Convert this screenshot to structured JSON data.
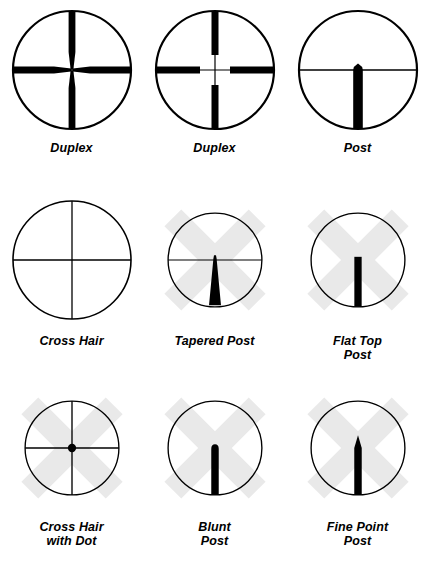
{
  "page": {
    "background_color": "#ffffff",
    "ink_color": "#000000",
    "watermark_color": "#e9e9e9",
    "columns": 3,
    "rows": 3
  },
  "watermark": {
    "name": "x-cross-watermark",
    "color": "#e9e9e9",
    "shape": "diagonal-cross",
    "band_width": 30,
    "length": 150
  },
  "reticles": [
    {
      "id": "duplex-tapered",
      "label": "Duplex",
      "type": "duplex",
      "variant": "tapered",
      "watermark": false,
      "has_horizontal_line": true,
      "has_vertical_line": true,
      "thick_bar_width": 7,
      "thin_line_width": 1.2,
      "taper_start_radius": 22,
      "description": "Thick posts from rim tapering to fine crosshair at center"
    },
    {
      "id": "duplex-blunt",
      "label": "Duplex",
      "type": "duplex",
      "variant": "blunt",
      "watermark": false,
      "has_horizontal_line": true,
      "has_vertical_line": true,
      "thick_bar_width": 7,
      "thin_line_width": 1.2,
      "gap_radius": 24,
      "description": "Thick posts from rim stopping abruptly, fine crosshair continues to center"
    },
    {
      "id": "post",
      "label": "Post",
      "type": "post",
      "variant": "peaked",
      "watermark": false,
      "has_horizontal_line": true,
      "has_vertical_line": false,
      "post_width": 9,
      "tip": "small-peak",
      "tip_height": 7,
      "description": "Horizontal hair with heavy vertical post rising from bottom to a small peaked tip"
    },
    {
      "id": "cross-hair",
      "label": "Cross Hair",
      "type": "crosshair",
      "variant": "plain",
      "watermark": false,
      "has_horizontal_line": true,
      "has_vertical_line": true,
      "line_width": 1.2,
      "description": "Plain fine crosshair spanning full field"
    },
    {
      "id": "tapered-post",
      "label": "Tapered Post",
      "type": "post",
      "variant": "tapered",
      "watermark": true,
      "has_horizontal_line": true,
      "has_vertical_line": false,
      "base_width": 15,
      "tip_width": 3,
      "tip_height": 6,
      "description": "Horizontal hair with wedge-shaped post widening toward the bottom"
    },
    {
      "id": "flat-top-post",
      "label": "Flat Top\nPost",
      "type": "post",
      "variant": "flat-top",
      "watermark": true,
      "has_horizontal_line": false,
      "has_vertical_line": false,
      "post_width": 9,
      "tip": "flat",
      "description": "Plain rectangular post with a square flat top, no horizontal hair"
    },
    {
      "id": "cross-hair-with-dot",
      "label": "Cross Hair\nwith Dot",
      "type": "crosshair",
      "variant": "dot",
      "watermark": true,
      "has_horizontal_line": true,
      "has_vertical_line": true,
      "line_width": 1.6,
      "dot_radius": 5,
      "description": "Fine crosshair with a solid aiming dot at the intersection"
    },
    {
      "id": "blunt-post",
      "label": "Blunt\nPost",
      "type": "post",
      "variant": "blunt",
      "watermark": true,
      "has_horizontal_line": false,
      "has_vertical_line": false,
      "post_width": 9,
      "tip": "rounded",
      "description": "Rectangular post with a rounded blunt tip, no horizontal hair"
    },
    {
      "id": "fine-point-post",
      "label": "Fine Point\nPost",
      "type": "post",
      "variant": "fine-point",
      "watermark": true,
      "has_horizontal_line": false,
      "has_vertical_line": false,
      "post_width": 9,
      "tip": "sharp-point",
      "tip_height": 16,
      "description": "Rectangular post rising to a sharp pointed tip, no horizontal hair"
    }
  ]
}
